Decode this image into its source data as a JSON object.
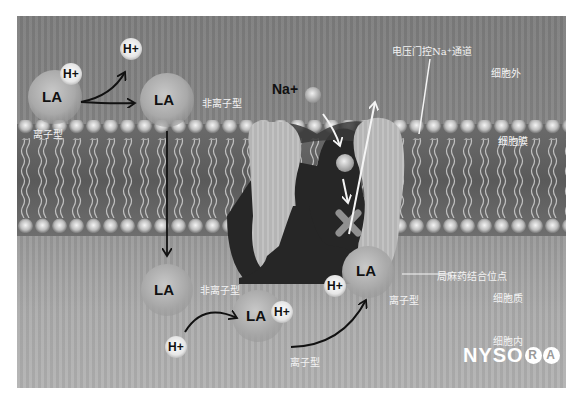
{
  "diagram": {
    "molecule_label": "LA",
    "proton_label": "H+",
    "sodium_label": "Na+",
    "labels": {
      "ionized_top": "离子型",
      "nonionized_top": "非离子型",
      "nonionized_bottom": "非离子型",
      "ionized_bottom": "离子型",
      "ionized_channel": "离子型",
      "channel": "电压门控Na⁺通道",
      "extracellular": "细胞外",
      "membrane": "细胞膜",
      "binding_site": "局麻药结合位点",
      "cytoplasm": "细胞质",
      "intracellular": "细胞内"
    },
    "logo": {
      "text": "NYSO",
      "circled": [
        "R",
        "A"
      ]
    },
    "colors": {
      "background": "#858585",
      "channel_protein": "#b8b8b8",
      "pore": "#2a2a2a",
      "label_text": "#f2f2f2",
      "arrow": "#111111"
    }
  }
}
